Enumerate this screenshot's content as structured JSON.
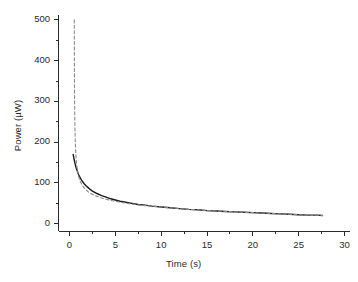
{
  "chart_data": {
    "type": "line",
    "title": "",
    "subtitle": "",
    "xlabel": "Time (s)",
    "ylabel": "Power (µW)",
    "xlim": [
      -1.2,
      30.6
    ],
    "ylim": [
      -18,
      512
    ],
    "grid": false,
    "legend_position": "none",
    "x_ticks": [
      0,
      5,
      10,
      15,
      20,
      25,
      30
    ],
    "x_tick_labels": [
      "0",
      "5",
      "10",
      "15",
      "20",
      "25",
      "30"
    ],
    "x_minor_ticks": [
      2.5,
      7.5,
      12.5,
      17.5,
      22.5,
      27.5
    ],
    "y_ticks": [
      0,
      100,
      200,
      300,
      400,
      500
    ],
    "y_tick_labels": [
      "0",
      "100",
      "200",
      "300",
      "400",
      "500"
    ],
    "y_minor_ticks": [
      50,
      150,
      250,
      350,
      450
    ],
    "series": [
      {
        "name": "measured",
        "style": "solid",
        "color": "#1a1a1a",
        "width": 1.4,
        "points": [
          [
            0.4,
            170
          ],
          [
            0.5,
            158
          ],
          [
            0.6,
            148
          ],
          [
            0.7,
            139
          ],
          [
            0.8,
            132
          ],
          [
            0.9,
            126
          ],
          [
            1.0,
            120
          ],
          [
            1.2,
            111
          ],
          [
            1.4,
            104
          ],
          [
            1.6,
            98
          ],
          [
            1.8,
            93
          ],
          [
            2.0,
            89
          ],
          [
            2.25,
            84
          ],
          [
            2.5,
            80
          ],
          [
            2.75,
            77
          ],
          [
            3.0,
            74
          ],
          [
            3.5,
            69
          ],
          [
            4.0,
            65
          ],
          [
            4.5,
            61
          ],
          [
            5.0,
            58
          ],
          [
            5.5,
            55
          ],
          [
            6.0,
            53
          ],
          [
            6.5,
            51
          ],
          [
            7.0,
            49
          ],
          [
            7.5,
            47
          ],
          [
            8.0,
            46
          ],
          [
            9.0,
            43
          ],
          [
            10.0,
            41
          ],
          [
            11.0,
            39
          ],
          [
            12.0,
            37
          ],
          [
            13.0,
            35
          ],
          [
            14.0,
            34
          ],
          [
            15.0,
            32
          ],
          [
            16.0,
            31
          ],
          [
            17.0,
            30
          ],
          [
            18.0,
            29
          ],
          [
            19.0,
            28
          ],
          [
            20.0,
            27
          ],
          [
            21.0,
            26
          ],
          [
            22.0,
            25
          ],
          [
            23.0,
            24
          ],
          [
            24.0,
            23
          ],
          [
            25.0,
            22
          ],
          [
            26.0,
            21
          ],
          [
            27.0,
            21
          ],
          [
            27.6,
            20
          ]
        ]
      },
      {
        "name": "model",
        "style": "dashed",
        "color": "#8c8c8c",
        "width": 1.1,
        "points": [
          [
            0.52,
            500
          ],
          [
            0.53,
            430
          ],
          [
            0.54,
            370
          ],
          [
            0.55,
            315
          ],
          [
            0.57,
            268
          ],
          [
            0.6,
            228
          ],
          [
            0.64,
            196
          ],
          [
            0.7,
            168
          ],
          [
            0.78,
            145
          ],
          [
            0.88,
            128
          ],
          [
            1.0,
            115
          ],
          [
            1.2,
            102
          ],
          [
            1.4,
            94
          ],
          [
            1.6,
            88
          ],
          [
            1.8,
            83
          ],
          [
            2.0,
            79
          ],
          [
            2.25,
            75
          ],
          [
            2.5,
            72
          ],
          [
            2.75,
            69
          ],
          [
            3.0,
            67
          ],
          [
            3.5,
            63
          ],
          [
            4.0,
            60
          ],
          [
            4.5,
            57
          ],
          [
            5.0,
            55
          ],
          [
            5.5,
            53
          ],
          [
            6.0,
            51
          ],
          [
            6.5,
            49
          ],
          [
            7.0,
            48
          ],
          [
            7.5,
            46
          ],
          [
            8.0,
            45
          ],
          [
            9.0,
            43
          ],
          [
            10.0,
            41
          ],
          [
            11.0,
            39
          ],
          [
            12.0,
            37
          ],
          [
            13.0,
            35
          ],
          [
            14.0,
            34
          ],
          [
            15.0,
            32
          ],
          [
            16.0,
            31
          ],
          [
            17.0,
            30
          ],
          [
            18.0,
            29
          ],
          [
            19.0,
            28
          ],
          [
            20.0,
            27
          ],
          [
            21.0,
            26
          ],
          [
            22.0,
            25
          ],
          [
            23.0,
            24
          ],
          [
            24.0,
            23
          ],
          [
            25.0,
            22
          ],
          [
            26.0,
            21
          ],
          [
            27.0,
            21
          ],
          [
            27.6,
            20
          ]
        ]
      }
    ]
  },
  "axes": {
    "spine_color": "#2b2b2b",
    "tick_color": "#2b2b2b",
    "background": "#ffffff"
  }
}
